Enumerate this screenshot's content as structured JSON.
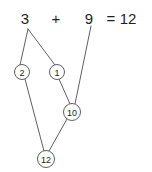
{
  "diagram": {
    "equation": {
      "left_operand": "3",
      "operator": "+",
      "right_operand": "9",
      "equals_sign": "=",
      "result": "12"
    },
    "nodes": [
      {
        "id": "n2",
        "label": "2",
        "cx": 22,
        "cy": 72,
        "r": 7.5
      },
      {
        "id": "n1",
        "label": "1",
        "cx": 57,
        "cy": 72,
        "r": 7.5
      },
      {
        "id": "n10",
        "label": "10",
        "cx": 72,
        "cy": 112,
        "r": 8.5
      },
      {
        "id": "n12",
        "label": "12",
        "cx": 46,
        "cy": 159,
        "r": 8.5
      }
    ],
    "edges": [
      {
        "id": "e-3-2",
        "from": "operand-3",
        "to": "n2",
        "x1": 28,
        "y1": 29,
        "x2": 20,
        "y2": 65
      },
      {
        "id": "e-3-1",
        "from": "operand-3",
        "to": "n1",
        "x1": 28,
        "y1": 29,
        "x2": 55,
        "y2": 65
      },
      {
        "id": "e-1-10",
        "from": "n1",
        "to": "n10",
        "x1": 59,
        "y1": 79,
        "x2": 70,
        "y2": 104
      },
      {
        "id": "e-9-10",
        "from": "operand-9",
        "to": "n10",
        "x1": 91,
        "y1": 26,
        "x2": 75,
        "y2": 104
      },
      {
        "id": "e-2-12",
        "from": "n2",
        "to": "n12",
        "x1": 25,
        "y1": 79,
        "x2": 44,
        "y2": 151
      },
      {
        "id": "e-10-12",
        "from": "n10",
        "to": "n12",
        "x1": 67,
        "y1": 119,
        "x2": 49,
        "y2": 151
      }
    ],
    "equation_positions": {
      "left_operand_x": 25,
      "left_operand_y": 24,
      "operator_x": 56,
      "operator_y": 24,
      "right_operand_x": 86,
      "right_operand_y": 24,
      "equals_x": 107,
      "equals_y": 24,
      "result_x": 119,
      "result_y": 24
    },
    "colors": {
      "text": "#231f20",
      "stroke": "#4d4d4d",
      "background": "#ffffff"
    }
  }
}
